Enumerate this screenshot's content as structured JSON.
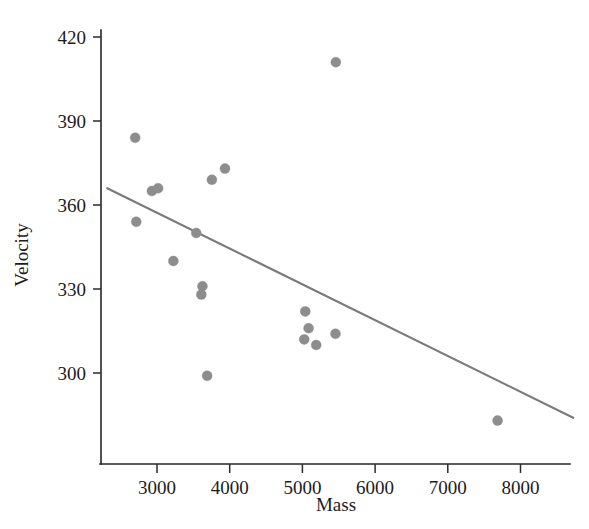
{
  "chart_data": {
    "type": "scatter",
    "title": "",
    "xlabel": "Mass",
    "ylabel": "Velocity",
    "xlim": [
      2300,
      8700
    ],
    "ylim": [
      275,
      430
    ],
    "grid": false,
    "legend": "none",
    "xticks": [
      3000,
      4000,
      5000,
      6000,
      7000,
      8000
    ],
    "xtick_labels": [
      "3000",
      "4000",
      "5000",
      "6000",
      "7000",
      "8000"
    ],
    "yticks": [
      300,
      330,
      360,
      390,
      420
    ],
    "ytick_labels": [
      "300",
      "330",
      "360",
      "390",
      "420"
    ],
    "marker_color": "#8d8d8d",
    "marker_size": 9,
    "line_color": "#7a7a7a",
    "axis_color": "#262626",
    "x": [
      5460,
      2700,
      3935,
      3755,
      3015,
      2930,
      2715,
      3540,
      3225,
      3625,
      3610,
      5040,
      5085,
      5455,
      5025,
      5190,
      3690,
      7685
    ],
    "y": [
      411,
      384,
      373,
      369,
      366,
      365,
      354,
      350,
      340,
      331,
      328,
      322,
      316,
      314,
      312,
      310,
      299,
      283
    ],
    "points": [
      {
        "mass": 5460,
        "velocity": 411
      },
      {
        "mass": 2700,
        "velocity": 384
      },
      {
        "mass": 3935,
        "velocity": 373
      },
      {
        "mass": 3755,
        "velocity": 369
      },
      {
        "mass": 3015,
        "velocity": 366
      },
      {
        "mass": 2930,
        "velocity": 365
      },
      {
        "mass": 2715,
        "velocity": 354
      },
      {
        "mass": 3540,
        "velocity": 350
      },
      {
        "mass": 3225,
        "velocity": 340
      },
      {
        "mass": 3625,
        "velocity": 331
      },
      {
        "mass": 3610,
        "velocity": 328
      },
      {
        "mass": 5040,
        "velocity": 322
      },
      {
        "mass": 5085,
        "velocity": 316
      },
      {
        "mass": 5455,
        "velocity": 314
      },
      {
        "mass": 5025,
        "velocity": 312
      },
      {
        "mass": 5190,
        "velocity": 310
      },
      {
        "mass": 3690,
        "velocity": 299
      },
      {
        "mass": 7685,
        "velocity": 283
      }
    ],
    "trend_line": {
      "type": "linear-fit",
      "x_start": 2315,
      "y_start": 366,
      "x_end": 8725,
      "y_end": 284
    }
  }
}
